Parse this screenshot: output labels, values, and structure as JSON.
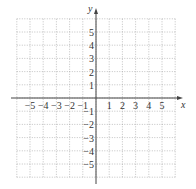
{
  "chart_data": {
    "type": "scatter",
    "title": "",
    "xlabel": "x",
    "ylabel": "y",
    "xlim": [
      -6,
      6
    ],
    "ylim": [
      -6,
      6
    ],
    "grid": true,
    "x_ticks": [
      "-5",
      "-4",
      "-3",
      "-2",
      "-1",
      "1",
      "2",
      "3",
      "4",
      "5"
    ],
    "y_ticks": [
      "5",
      "4",
      "3",
      "2",
      "1",
      "-1",
      "-2",
      "-3",
      "-4",
      "-5"
    ],
    "series": []
  },
  "labels": {
    "x_axis": "x",
    "y_axis": "y"
  }
}
